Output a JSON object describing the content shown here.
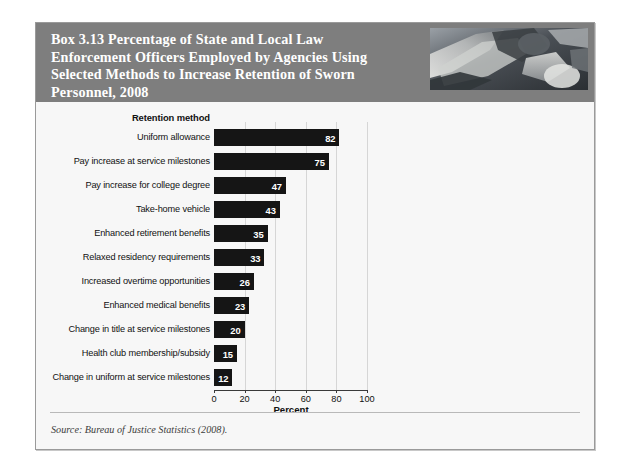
{
  "box": {
    "title": "Box 3.13   Percentage of State and Local Law\nEnforcement Officers Employed by Agencies Using\nSelected Methods to Increase Retention of Sworn\nPersonnel, 2008",
    "header_photo_alt": "police-officer-photo",
    "source": "Source: Bureau of Justice Statistics (2008).",
    "colors": {
      "header_band": "#7e7e7e",
      "body": "#f7f7f7",
      "bar": "#151515",
      "gridline": "#d6d6d6",
      "border": "#9a9a9a"
    }
  },
  "chart_data": {
    "type": "bar",
    "orientation": "horizontal",
    "title": "",
    "category_axis_title": "Retention method",
    "xlabel": "Percent",
    "ylabel": "",
    "xlim": [
      0,
      100
    ],
    "xticks": [
      0,
      20,
      40,
      60,
      80,
      100
    ],
    "grid": true,
    "legend": false,
    "value_labels": true,
    "categories": [
      "Uniform allowance",
      "Pay increase at service milestones",
      "Pay increase for college degree",
      "Take-home vehicle",
      "Enhanced retirement benefits",
      "Relaxed residency requirements",
      "Increased overtime opportunities",
      "Enhanced medical benefits",
      "Change in title at service milestones",
      "Health club membership/subsidy",
      "Change in uniform at service milestones"
    ],
    "values": [
      82,
      75,
      47,
      43,
      35,
      33,
      26,
      23,
      20,
      15,
      12
    ]
  }
}
